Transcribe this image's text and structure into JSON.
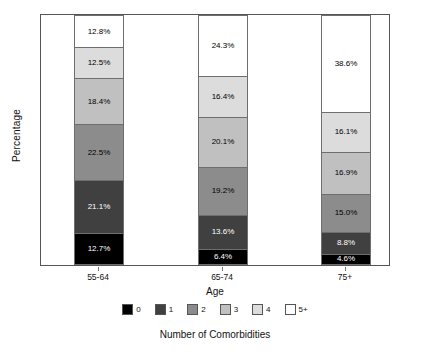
{
  "chart_data": {
    "type": "bar",
    "variant": "stacked-100-percent",
    "title": "",
    "xlabel": "Age",
    "ylabel": "Percentage",
    "caption": "Number of Comorbidities",
    "categories": [
      "55-64",
      "65-74",
      "75+"
    ],
    "ylim": [
      0,
      100
    ],
    "grid": false,
    "legend_position": "bottom",
    "legend_title": "Number of Comorbidities",
    "value_suffix": "%",
    "series": [
      {
        "name": "0",
        "color": "#000000",
        "text_color": "#ffffff",
        "values": [
          12.7,
          6.4,
          4.6
        ],
        "labels": [
          "12.7%",
          "6.4%",
          "4.6%"
        ]
      },
      {
        "name": "1",
        "color": "#404040",
        "text_color": "#ffffff",
        "values": [
          21.1,
          13.6,
          8.8
        ],
        "labels": [
          "21.1%",
          "13.6%",
          "8.8%"
        ]
      },
      {
        "name": "2",
        "color": "#8c8c8c",
        "text_color": "#000000",
        "values": [
          22.5,
          19.2,
          15.0
        ],
        "labels": [
          "22.5%",
          "19.2%",
          "15.0%"
        ]
      },
      {
        "name": "3",
        "color": "#c0c0c0",
        "text_color": "#000000",
        "values": [
          18.4,
          20.1,
          16.9
        ],
        "labels": [
          "18.4%",
          "20.1%",
          "16.9%"
        ]
      },
      {
        "name": "4",
        "color": "#dcdcdc",
        "text_color": "#000000",
        "values": [
          12.5,
          16.4,
          16.1
        ],
        "labels": [
          "12.5%",
          "16.4%",
          "16.1%"
        ]
      },
      {
        "name": "5+",
        "color": "#ffffff",
        "text_color": "#000000",
        "values": [
          12.8,
          24.3,
          38.6
        ],
        "labels": [
          "12.8%",
          "24.3%",
          "38.6%"
        ]
      }
    ],
    "legend_entries": [
      {
        "label": "0",
        "color": "#000000"
      },
      {
        "label": "1",
        "color": "#404040"
      },
      {
        "label": "2",
        "color": "#8c8c8c"
      },
      {
        "label": "3",
        "color": "#c0c0c0"
      },
      {
        "label": "4",
        "color": "#dcdcdc"
      },
      {
        "label": "5+",
        "color": "#ffffff"
      }
    ]
  }
}
